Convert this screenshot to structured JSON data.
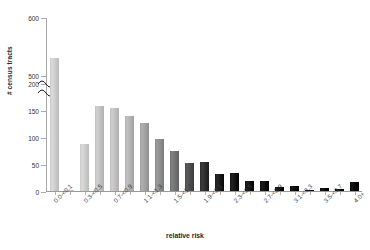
{
  "chart_data": {
    "type": "bar",
    "title": "",
    "xlabel": "relative risk",
    "ylabel": "# census tracts",
    "ylim": [
      0,
      600
    ],
    "grid": false,
    "legend": null,
    "axis_break": {
      "present": true,
      "lower_segment": [
        0,
        200
      ],
      "upper_segment": [
        500,
        600
      ]
    },
    "ytick_labels": [
      "0",
      "50",
      "100",
      "150",
      "200",
      "500",
      "600"
    ],
    "ytick_values": [
      0,
      50,
      100,
      150,
      200,
      500,
      600
    ],
    "categories": [
      "0.0-<0.1",
      "0.1-<0.3",
      "0.3-<0.5",
      "0.5-<0.7",
      "0.7-<0.9",
      "0.9-<1.1",
      "1.1-<1.3",
      "1.3-<1.5",
      "1.5-<1.7",
      "1.7-<1.9",
      "1.9-<2.1",
      "2.1-<2.3",
      "2.3-<2.5",
      "2.5-<2.7",
      "2.7-<2.9",
      "2.9-<3.1",
      "3.1-<3.3",
      "3.3-<3.5",
      "3.5-<3.7",
      "3.7-<3.9",
      "4.0+"
    ],
    "xtick_labels_shown": [
      "0.0-<0.1",
      "0.3-<0.5",
      "0.7-<0.9",
      "1.1-<1.3",
      "1.5-<1.7",
      "1.9-<2.1",
      "2.3-<2.5",
      "2.7-<2.9",
      "3.1-<3.3",
      "3.5-<3.7",
      "4.0+"
    ],
    "values": [
      530,
      2,
      88,
      157,
      153,
      139,
      127,
      96,
      74,
      52,
      53,
      32,
      34,
      19,
      19,
      7,
      10,
      2,
      5,
      3,
      16
    ],
    "bar_colors": [
      "#c9c9c9",
      "#c9c9c9",
      "#c9c9c9",
      "#bfbfbf",
      "#bdbdbd",
      "#b0b0b0",
      "#9e9e9e",
      "#8a8a8a",
      "#6f6f6f",
      "#4a4a4a",
      "#2a2a2a",
      "#161616",
      "#101010",
      "#0c0c0c",
      "#0a0a0a",
      "#080808",
      "#080808",
      "#070707",
      "#070707",
      "#060606",
      "#050505"
    ]
  }
}
